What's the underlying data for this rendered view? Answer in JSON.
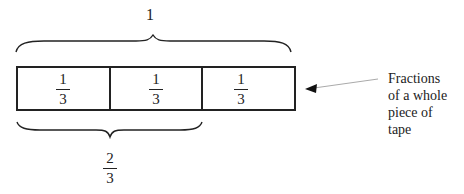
{
  "diagram": {
    "whole_label": "1",
    "tape": {
      "segments": [
        {
          "numerator": "1",
          "denominator": "3"
        },
        {
          "numerator": "1",
          "denominator": "3"
        },
        {
          "numerator": "1",
          "denominator": "3"
        }
      ]
    },
    "bottom_brace_label": {
      "numerator": "2",
      "denominator": "3"
    },
    "callout": {
      "lines": [
        "Fractions",
        "of a whole",
        "piece of",
        "tape"
      ]
    },
    "colors": {
      "stroke": "#222222",
      "arrow_line": "#aaaaaa",
      "background": "#ffffff"
    }
  }
}
